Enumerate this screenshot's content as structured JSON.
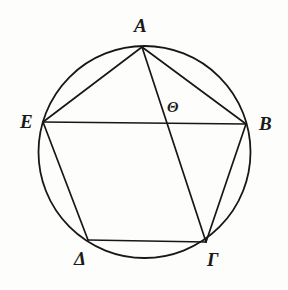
{
  "figure": {
    "background_color": "#fdfdfc",
    "stroke_color": "#171717",
    "label_color": "#1a1a1a"
  },
  "circle": {
    "name": "circumscribed-circle",
    "center_x": 144.5,
    "center_y": 152,
    "radius": 106,
    "stroke_width": 1.8
  },
  "points": {
    "A": {
      "label": "A",
      "x": 142,
      "y": 47,
      "label_x": 134,
      "label_y": 16
    },
    "B": {
      "label": "B",
      "x": 246,
      "y": 124,
      "label_x": 259,
      "label_y": 114
    },
    "G": {
      "label": "Γ",
      "x": 206,
      "y": 242,
      "label_x": 207,
      "label_y": 250
    },
    "D": {
      "label": "Δ",
      "x": 88,
      "y": 240,
      "label_x": 74,
      "label_y": 249
    },
    "E": {
      "label": "E",
      "x": 43,
      "y": 122,
      "label_x": 20,
      "label_y": 112
    },
    "TH": {
      "label": "Θ",
      "x": 176,
      "y": 122,
      "label_x": 167,
      "label_y": 100
    }
  },
  "segments": [
    {
      "name": "segment-A-E",
      "from": "A",
      "to": "E",
      "stroke_width": 1.7
    },
    {
      "name": "segment-A-B",
      "from": "A",
      "to": "B",
      "stroke_width": 1.7
    },
    {
      "name": "segment-A-Gamma",
      "from": "A",
      "to": "G",
      "stroke_width": 1.7
    },
    {
      "name": "segment-E-B",
      "from": "E",
      "to": "B",
      "stroke_width": 1.7
    },
    {
      "name": "segment-E-Delta",
      "from": "E",
      "to": "D",
      "stroke_width": 1.7
    },
    {
      "name": "segment-Delta-Gamma",
      "from": "D",
      "to": "G",
      "stroke_width": 1.7
    },
    {
      "name": "segment-Gamma-B",
      "from": "G",
      "to": "B",
      "stroke_width": 1.7
    }
  ]
}
